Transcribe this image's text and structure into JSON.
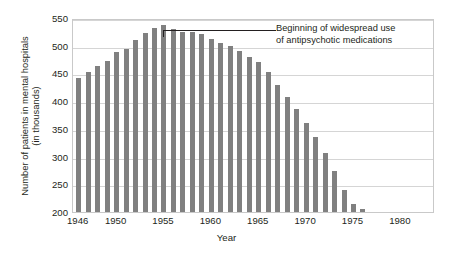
{
  "chart_data": {
    "type": "bar",
    "title": "",
    "xlabel": "Year",
    "ylabel": "Number of patients in mental hospitals",
    "ylabel_line2": "(in thousands)",
    "ylim": [
      200,
      550
    ],
    "yticks": [
      200,
      250,
      300,
      350,
      400,
      450,
      500,
      550
    ],
    "xticks": [
      1946,
      1950,
      1955,
      1960,
      1965,
      1970,
      1975,
      1980
    ],
    "xlim": [
      1945.4,
      1983.6
    ],
    "grid": true,
    "legend": null,
    "bar_color": "#808080",
    "frame_color": "#c9c9c9",
    "grid_color": "#d5d5d5",
    "text_color": "#231f20",
    "annotations": [
      {
        "text_line1": "Beginning of widespread use",
        "text_line2": "of antipsychotic medications",
        "points_to_year": 1955,
        "points_to_value": 530
      }
    ],
    "categories": [
      1946,
      1947,
      1948,
      1949,
      1950,
      1951,
      1952,
      1953,
      1954,
      1955,
      1956,
      1957,
      1958,
      1959,
      1960,
      1961,
      1962,
      1963,
      1964,
      1965,
      1966,
      1967,
      1968,
      1969,
      1970,
      1971,
      1972,
      1973,
      1974,
      1975,
      1976,
      1977,
      1978,
      1979,
      1980,
      1981,
      1982,
      1983
    ],
    "values": [
      442,
      453,
      464,
      473,
      489,
      495,
      511,
      523,
      532,
      537,
      530,
      524,
      524,
      521,
      512,
      505,
      499,
      490,
      480,
      470,
      452,
      430,
      407,
      385,
      360,
      335,
      306,
      274,
      240,
      215,
      205,
      198,
      190,
      182,
      175,
      170,
      167,
      165
    ]
  }
}
